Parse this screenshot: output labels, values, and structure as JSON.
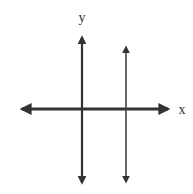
{
  "diagram": {
    "type": "coordinate-plane",
    "x_axis_label": "x",
    "y_axis_label": "y",
    "colors": {
      "line": "#333333",
      "background": "#ffffff"
    },
    "elements": [
      {
        "name": "x-axis",
        "orientation": "horizontal",
        "arrows": "both"
      },
      {
        "name": "y-axis",
        "orientation": "vertical",
        "arrows": "both"
      },
      {
        "name": "vertical-line",
        "orientation": "vertical",
        "arrows": "both",
        "position": "right of y-axis, crossing x-axis"
      }
    ]
  }
}
